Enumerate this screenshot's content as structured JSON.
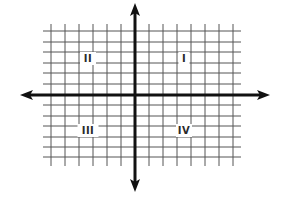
{
  "diagram": {
    "type": "coordinate-plane",
    "grid": {
      "x_lines": [
        51,
        65,
        79,
        93,
        107,
        121,
        149,
        163,
        177,
        191,
        205,
        219,
        233
      ],
      "y_lines": [
        31,
        42,
        52,
        63,
        73,
        84,
        105,
        116,
        126,
        137,
        147,
        157
      ],
      "x_extent": [
        43,
        241
      ],
      "y_extent": [
        24,
        166
      ],
      "line_color": "#555555"
    },
    "axes": {
      "origin": [
        135,
        95
      ],
      "x_axis_extent": [
        20,
        270
      ],
      "y_axis_extent": [
        3,
        192
      ],
      "color": "#111111"
    },
    "quadrants": [
      {
        "id": "q1",
        "label": "I",
        "x": 184,
        "y": 62
      },
      {
        "id": "q2",
        "label": "II",
        "x": 88,
        "y": 62
      },
      {
        "id": "q3",
        "label": "III",
        "x": 88,
        "y": 134
      },
      {
        "id": "q4",
        "label": "IV",
        "x": 184,
        "y": 134
      }
    ]
  }
}
